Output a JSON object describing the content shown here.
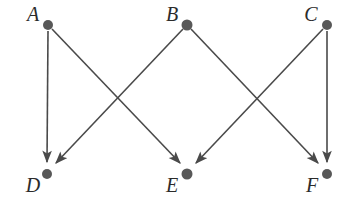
{
  "diagram": {
    "type": "directed-graph",
    "title": "",
    "background_color": "#ffffff",
    "node_color": "#585858",
    "edge_color": "#4a4a4a",
    "label_color": "#2b2b2b",
    "node_radius": 5,
    "arrow_style": "solid-filled-triangle",
    "nodes": [
      {
        "id": "A",
        "label": "A",
        "x": 48,
        "y": 25,
        "label_x": 33,
        "label_y": 21,
        "row": "top"
      },
      {
        "id": "B",
        "label": "B",
        "x": 187,
        "y": 25,
        "label_x": 172,
        "label_y": 21,
        "row": "top"
      },
      {
        "id": "C",
        "label": "C",
        "x": 327,
        "y": 25,
        "label_x": 311,
        "label_y": 21,
        "row": "top"
      },
      {
        "id": "D",
        "label": "D",
        "x": 47,
        "y": 174,
        "label_x": 33,
        "label_y": 192,
        "row": "bottom"
      },
      {
        "id": "E",
        "label": "E",
        "x": 187,
        "y": 174,
        "label_x": 172,
        "label_y": 192,
        "row": "bottom"
      },
      {
        "id": "F",
        "label": "F",
        "x": 327,
        "y": 174,
        "label_x": 312,
        "label_y": 192,
        "row": "bottom"
      }
    ],
    "edges": [
      {
        "id": "A-D",
        "from": "A",
        "to": "D",
        "directed": true,
        "shape": "vertical"
      },
      {
        "id": "A-E",
        "from": "A",
        "to": "E",
        "directed": true,
        "shape": "diagonal-right"
      },
      {
        "id": "B-D",
        "from": "B",
        "to": "D",
        "directed": true,
        "shape": "diagonal-left"
      },
      {
        "id": "B-F",
        "from": "B",
        "to": "F",
        "directed": true,
        "shape": "diagonal-right"
      },
      {
        "id": "C-E",
        "from": "C",
        "to": "E",
        "directed": true,
        "shape": "diagonal-left"
      },
      {
        "id": "C-F",
        "from": "C",
        "to": "F",
        "directed": true,
        "shape": "vertical"
      }
    ]
  }
}
